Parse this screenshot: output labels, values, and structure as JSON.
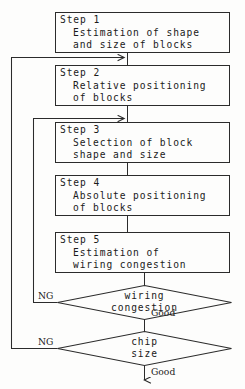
{
  "diagram": {
    "stroke_color": "#2b2b2b",
    "text_color": "#1a1a1a",
    "background_color": "#fdfdfc",
    "steps": [
      {
        "id": "step1",
        "heading": "Step 1",
        "line1": "Estimation of shape",
        "line2": "and size of blocks"
      },
      {
        "id": "step2",
        "heading": "Step 2",
        "line1": "Relative positioning",
        "line2": "of blocks"
      },
      {
        "id": "step3",
        "heading": "Step 3",
        "line1": "Selection of block",
        "line2": "shape and size"
      },
      {
        "id": "step4",
        "heading": "Step 4",
        "line1": "Absolute positioning",
        "line2": "of blocks"
      },
      {
        "id": "step5",
        "heading": "Step 5",
        "line1": "Estimation of",
        "line2": "wiring congestion"
      }
    ],
    "decisions": [
      {
        "id": "decision-wiring-congestion",
        "line1": "wiring",
        "line2": "congestion",
        "fail_label": "NG",
        "pass_label": "Good"
      },
      {
        "id": "decision-chip-size",
        "line1": "chip",
        "line2": "size",
        "fail_label": "NG",
        "pass_label": "Good"
      }
    ]
  }
}
